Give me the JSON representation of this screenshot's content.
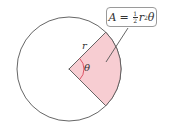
{
  "diagram": {
    "formula": {
      "lhs": "A",
      "equals": "=",
      "frac_num": "1",
      "frac_den": "2",
      "var_r": "r",
      "exponent": "2",
      "var_theta": "θ"
    },
    "labels": {
      "radius": "r",
      "angle": "θ"
    },
    "colors": {
      "sector_fill": "#f7cdd2",
      "circle_stroke": "#555555",
      "angle_arc": "#d9455a",
      "box_border": "#9a9a9a"
    },
    "geometry": {
      "center": [
        69,
        69
      ],
      "radius": 52,
      "sector_start_deg": -45,
      "sector_end_deg": 45
    }
  }
}
